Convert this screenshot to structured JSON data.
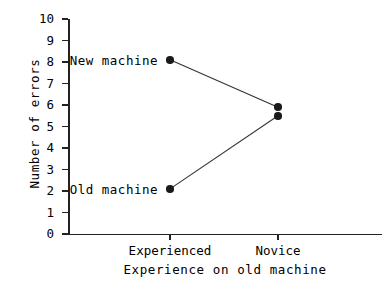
{
  "chart_data": {
    "type": "line",
    "title": "",
    "xlabel": "Experience on old machine",
    "ylabel": "Number of errors",
    "categories": [
      "Experienced",
      "Novice"
    ],
    "xtick_labels": [
      "Experienced",
      "Novice"
    ],
    "ytick_labels": [
      "0",
      "1",
      "2",
      "3",
      "4",
      "5",
      "6",
      "7",
      "8",
      "9",
      "10"
    ],
    "ylim": [
      0,
      10
    ],
    "ytick_values": [
      0,
      1,
      2,
      3,
      4,
      5,
      6,
      7,
      8,
      9,
      10
    ],
    "grid": false,
    "legend_position": "inline-point-labels",
    "series": [
      {
        "name": "New machine",
        "values": [
          8.1,
          5.9
        ],
        "label_text": "New machine",
        "marker": "filled-circle",
        "color": "#1a1a1a"
      },
      {
        "name": "Old machine",
        "values": [
          2.1,
          5.5
        ],
        "label_text": "Old machine",
        "marker": "filled-circle",
        "color": "#1a1a1a"
      }
    ],
    "annotations": [
      {
        "text": "New machine",
        "at_category": "Experienced",
        "at_value": 8.1
      },
      {
        "text": "Old machine",
        "at_category": "Experienced",
        "at_value": 2.1
      }
    ],
    "colors": {
      "axis": "#222222",
      "marker": "#1a1a1a",
      "line": "#333333",
      "background": "#ffffff"
    }
  },
  "axis": {
    "y_title": "Number of errors",
    "x_title": "Experience on old machine"
  }
}
